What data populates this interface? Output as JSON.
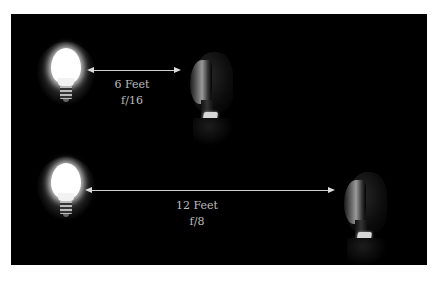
{
  "diagram": {
    "background": "#000000",
    "rows": [
      {
        "light_icon": "light-bulb-icon",
        "subject": "portrait-subject",
        "distance_label": "6 Feet",
        "aperture_label": "f/16"
      },
      {
        "light_icon": "light-bulb-icon",
        "subject": "portrait-subject",
        "distance_label": "12 Feet",
        "aperture_label": "f/8"
      }
    ],
    "arrow_color": "#cfcfcf",
    "label_color": "#bdbdbd"
  }
}
